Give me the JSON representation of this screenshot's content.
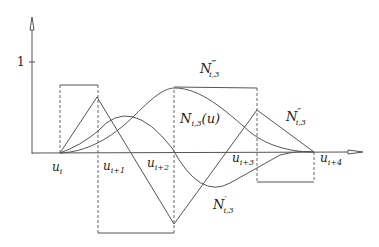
{
  "diagram": {
    "y_axis": {
      "tick_label": "1"
    },
    "knots": [
      {
        "base": "u",
        "sub": "i"
      },
      {
        "base": "u",
        "sub": "i+1"
      },
      {
        "base": "u",
        "sub": "i+2"
      },
      {
        "base": "u",
        "sub": "i+3"
      },
      {
        "base": "u",
        "sub": "i+4"
      }
    ],
    "curves": {
      "basis": {
        "base": "N",
        "sub": "i,3",
        "suffix": "(u)"
      },
      "first_derivative": {
        "base": "N",
        "prime": "′",
        "sub": "i,3"
      },
      "second_derivative": {
        "base": "N",
        "prime": "″",
        "sub": "i,3"
      },
      "third_derivative": {
        "base": "N",
        "prime": "‴",
        "sub": "i,3"
      }
    },
    "colors": {
      "line": "#555555",
      "text": "#222222"
    }
  }
}
